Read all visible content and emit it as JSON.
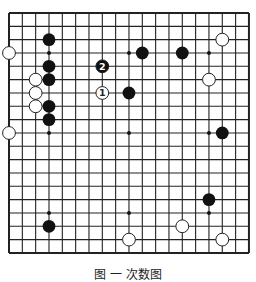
{
  "board": {
    "size": 19,
    "origin_x": 9,
    "origin_y": 13,
    "spacing_x": 13.33,
    "spacing_y": 13.33,
    "line_color": "#222222",
    "stone_radius": 6.4,
    "hoshi": [
      [
        3,
        3
      ],
      [
        9,
        3
      ],
      [
        15,
        3
      ],
      [
        3,
        9
      ],
      [
        9,
        9
      ],
      [
        15,
        9
      ],
      [
        3,
        15
      ],
      [
        9,
        15
      ],
      [
        15,
        15
      ]
    ],
    "black_stones": [
      {
        "c": 3,
        "r": 2
      },
      {
        "c": 3,
        "r": 4
      },
      {
        "c": 3,
        "r": 5
      },
      {
        "c": 3,
        "r": 7
      },
      {
        "c": 3,
        "r": 8
      },
      {
        "c": 10,
        "r": 3
      },
      {
        "c": 13,
        "r": 3
      },
      {
        "c": 9,
        "r": 6
      },
      {
        "c": 16,
        "r": 9
      },
      {
        "c": 15,
        "r": 14
      },
      {
        "c": 3,
        "r": 16
      }
    ],
    "white_stones": [
      {
        "c": 0,
        "r": 3
      },
      {
        "c": 2,
        "r": 5
      },
      {
        "c": 2,
        "r": 6
      },
      {
        "c": 2,
        "r": 7
      },
      {
        "c": 0,
        "r": 9
      },
      {
        "c": 16,
        "r": 2
      },
      {
        "c": 15,
        "r": 5
      },
      {
        "c": 13,
        "r": 16
      },
      {
        "c": 9,
        "r": 17
      },
      {
        "c": 16,
        "r": 17
      }
    ],
    "numbered_stones": [
      {
        "c": 7,
        "r": 6,
        "color": "white",
        "label": "1"
      },
      {
        "c": 7,
        "r": 4,
        "color": "black",
        "label": "2"
      }
    ]
  },
  "caption": "图 一 次数图"
}
